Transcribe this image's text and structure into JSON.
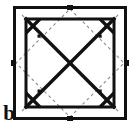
{
  "figure": {
    "panel_label": "b",
    "caption_position": "bottom-left",
    "background_color": "#ffffff",
    "stroke_color": "#111111",
    "dash_color": "#8d8d8d",
    "icons": {
      "panel-label": "letter-b-glyph",
      "dot": "filled-square-dot",
      "tick": "edge-tick-mark"
    }
  },
  "diagram_data": {
    "type": "geometric-construction",
    "description": "Square frame enclosing an X-shaped cross pattern forming four corner pentagons and one central diamond, each marked with a dot; faint dashed diamond overlay joins the mid-points of the frame edges.",
    "outer_square": {
      "x": 13,
      "y": 6,
      "width": 114,
      "height": 114,
      "stroke_width": 3
    },
    "inner_square": {
      "x": 25,
      "y": 18,
      "width": 90,
      "height": 90,
      "stroke_width": 3
    },
    "edge_ticks": [
      {
        "edge": "top",
        "x": 70,
        "y": 6
      },
      {
        "edge": "left",
        "x": 13,
        "y": 63
      },
      {
        "edge": "right",
        "x": 127,
        "y": 63
      },
      {
        "edge": "bottom",
        "x": 70,
        "y": 120
      }
    ],
    "diagonals": [
      {
        "name": "main-diagonal",
        "x1": 25,
        "y1": 18,
        "x2": 115,
        "y2": 108
      },
      {
        "name": "anti-diagonal",
        "x1": 115,
        "y1": 18,
        "x2": 25,
        "y2": 108
      }
    ],
    "dashed_overlay": {
      "name": "mid-point-diamond",
      "points": [
        [
          70,
          9
        ],
        [
          124,
          63
        ],
        [
          70,
          117
        ],
        [
          16,
          63
        ]
      ]
    },
    "cells": [
      {
        "name": "top-left-pentagon",
        "dot": [
          39,
          36
        ]
      },
      {
        "name": "top-right-pentagon",
        "dot": [
          100,
          36
        ]
      },
      {
        "name": "center-diamond",
        "dot": [
          70,
          63
        ]
      },
      {
        "name": "bottom-left-pentagon",
        "dot": [
          39,
          91
        ]
      },
      {
        "name": "bottom-right-pentagon",
        "dot": [
          100,
          91
        ]
      }
    ],
    "dot_size": 3,
    "counts": {
      "dots": 5,
      "pentagons": 4,
      "diamonds": 1,
      "ticks": 4
    }
  }
}
